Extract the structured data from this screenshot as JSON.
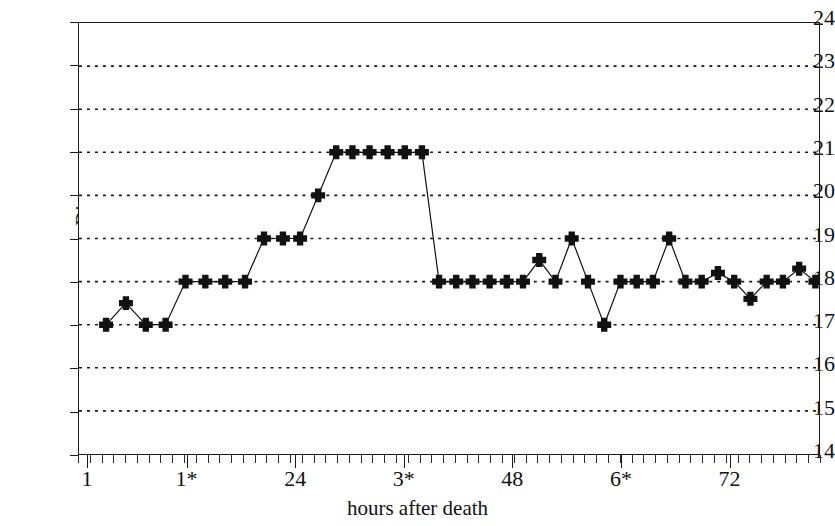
{
  "chart_data": {
    "type": "line",
    "title": "",
    "xlabel": "hours after death",
    "ylabel": "Diameter",
    "ylim": [
      14,
      24
    ],
    "xlim": [
      0,
      82
    ],
    "grid": true,
    "legend": false,
    "marker": "plus",
    "y_ticks": [
      24,
      23,
      22,
      21,
      20,
      19,
      18,
      17,
      16,
      15,
      14
    ],
    "y_tick_labels": [
      "24",
      "23",
      "22",
      "21",
      "20",
      "19",
      "18",
      "17",
      "16",
      "15",
      "14"
    ],
    "x_ticks": [
      1,
      12,
      24,
      36,
      48,
      60,
      72
    ],
    "x_tick_labels": [
      "1",
      "1*",
      "24",
      "3*",
      "48",
      "6*",
      "72"
    ],
    "x_minor_tick_count": 63,
    "series": [
      {
        "name": "Diameter",
        "color": "#111111",
        "x": [
          3.0,
          5.2,
          7.4,
          9.6,
          11.8,
          14.0,
          16.2,
          18.4,
          20.5,
          22.6,
          24.5,
          26.5,
          28.5,
          30.3,
          32.2,
          34.2,
          36.1,
          38.0,
          39.9,
          41.8,
          43.6,
          45.5,
          47.4,
          49.2,
          51.0,
          52.8,
          54.6,
          56.4,
          58.2,
          60.0,
          61.8,
          63.6,
          65.4,
          67.2,
          69.0,
          70.8,
          72.6,
          74.4,
          76.2,
          78.0,
          79.8,
          81.6,
          83.4,
          85.2,
          87.0,
          88.8,
          90.6,
          92.4,
          94.2,
          96.0,
          97.8,
          99.6,
          101.4,
          103.2,
          105.0,
          106.8,
          108.6,
          110.4,
          112.2,
          114.0,
          115.8,
          117.6,
          119.4,
          121.2,
          123.0,
          124.8,
          126.6,
          128.4,
          130.2,
          132.0,
          133.8,
          135.6,
          137.4
        ],
        "values": [
          17.0,
          17.5,
          17.0,
          17.0,
          18.0,
          18.0,
          18.0,
          18.0,
          19.0,
          19.0,
          19.0,
          20.0,
          21.0,
          21.0,
          21.0,
          21.0,
          21.0,
          21.0,
          18.0,
          18.0,
          18.0,
          18.0,
          18.0,
          18.0,
          18.5,
          18.0,
          19.0,
          18.0,
          17.0,
          18.0,
          18.0,
          18.0,
          19.0,
          18.0,
          18.0,
          18.2,
          18.0,
          17.6,
          18.0,
          18.0,
          18.3,
          18.0,
          18.0,
          18.4,
          18.0,
          17.8,
          18.0,
          18.5,
          18.0,
          18.0,
          18.5,
          18.0,
          18.0,
          18.0,
          18.3,
          18.0,
          17.9,
          18.0,
          18.4,
          18.0,
          18.0,
          18.0,
          18.0,
          17.9,
          18.0,
          17.7,
          18.0,
          18.0,
          18.0,
          18.0,
          17.9,
          18.0,
          17.6
        ]
      }
    ]
  }
}
